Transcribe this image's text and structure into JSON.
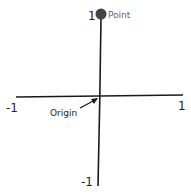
{
  "diagram": {
    "type": "coordinate-axes-sketch",
    "labels": {
      "y_max": "1",
      "y_min": "-1",
      "x_min": "-1",
      "x_max": "1",
      "point": "Point",
      "origin": "Origin"
    },
    "colors": {
      "ink": "#1a1a1a",
      "point_fill": "#444444",
      "background": "#ffffff"
    },
    "point_coords": [
      0,
      1
    ]
  }
}
